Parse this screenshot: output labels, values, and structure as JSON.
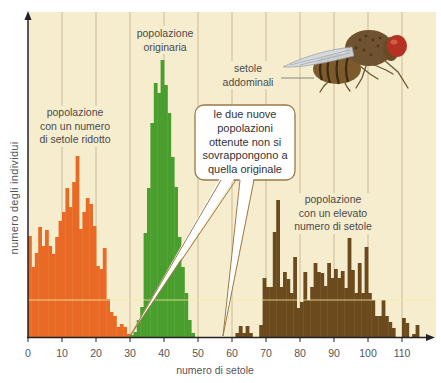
{
  "figure": {
    "plot_background_color": "#f6edcf",
    "axis_color": "#222222"
  },
  "chart_data": {
    "type": "bar",
    "subtype": "histogram",
    "title": "",
    "xlabel": "numero di setole",
    "ylabel": "numero degli individui",
    "xlim": [
      0,
      118
    ],
    "ylim": [
      0,
      326
    ],
    "xticks": [
      0,
      10,
      20,
      30,
      40,
      50,
      60,
      70,
      80,
      90,
      100,
      110
    ],
    "xtick_labels": [
      "0",
      "10",
      "20",
      "30",
      "40",
      "50",
      "60",
      "70",
      "80",
      "90",
      "100",
      "110"
    ],
    "yticks": [],
    "grid": {
      "vertical": true,
      "horizontal": false,
      "color": "#cdbb93"
    },
    "legend_position": "none",
    "bin_width": 1,
    "series": [
      {
        "key": "reduced",
        "name": "popolazione con un numero di setole ridotto",
        "color": "#e96a25",
        "x_start": 0,
        "values": [
          101,
          70,
          84,
          110,
          91,
          107,
          91,
          83,
          100,
          116,
          125,
          149,
          130,
          155,
          181,
          108,
          125,
          139,
          133,
          111,
          71,
          68,
          89,
          38,
          25,
          21,
          10,
          13,
          10,
          3
        ]
      },
      {
        "key": "original",
        "name": "popolazione originaria",
        "color": "#4a9e2e",
        "x_start": 30,
        "values": [
          2,
          5,
          17,
          30,
          104,
          149,
          214,
          254,
          244,
          277,
          252,
          224,
          180,
          150,
          100,
          70,
          44,
          17,
          4
        ]
      },
      {
        "key": "elevated",
        "name": "popolazione con un elevato numero di setole",
        "color": "#6b4a1e",
        "x_start": 61,
        "values": [
          4,
          11,
          4,
          11,
          4,
          0,
          0,
          12,
          59,
          50,
          50,
          105,
          137,
          50,
          65,
          58,
          44,
          80,
          29,
          35,
          65,
          37,
          50,
          74,
          65,
          64,
          51,
          74,
          59,
          68,
          59,
          66,
          49,
          99,
          67,
          44,
          74,
          44,
          90,
          44,
          37,
          21,
          21,
          37,
          21,
          15,
          9,
          0,
          0,
          19,
          14,
          0,
          3,
          12
        ]
      }
    ],
    "annotations": [
      {
        "id": "reduced-label",
        "lines": [
          "popolazione",
          "con un numero",
          "di setole ridotto"
        ]
      },
      {
        "id": "original-label",
        "lines": [
          "popolazione",
          "originaria"
        ]
      },
      {
        "id": "elevated-label",
        "lines": [
          "popolazione",
          "con un elevato",
          "numero di setole"
        ]
      },
      {
        "id": "callout",
        "lines": [
          "le due nuove",
          "popolazioni",
          "ottenute non si",
          "sovrappongono a",
          "quella originale"
        ],
        "points_to_x": [
          30,
          57
        ]
      },
      {
        "id": "fly-label",
        "lines": [
          "setole",
          "addominali"
        ]
      }
    ]
  },
  "illustration": {
    "icon": "fruit-fly-illustration",
    "body_color": "#7c5a2c",
    "eye_color": "#b53222",
    "wing_color": "#d3d8df"
  }
}
